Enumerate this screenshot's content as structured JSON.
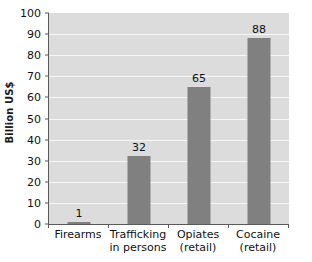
{
  "chart_data": {
    "type": "bar",
    "title": "",
    "xlabel": "",
    "ylabel": "Billion US$",
    "ylim": [
      0,
      100
    ],
    "ytick_labels": [
      "0",
      "10",
      "20",
      "30",
      "40",
      "50",
      "60",
      "70",
      "80",
      "90",
      "100"
    ],
    "ytick_values": [
      0,
      10,
      20,
      30,
      40,
      50,
      60,
      70,
      80,
      90,
      100
    ],
    "grid": "horizontal",
    "legend": "none",
    "categories": [
      "Firearms",
      "Trafficking in persons",
      "Opiates (retail)",
      "Cocaine (retail)"
    ],
    "category_lines": [
      [
        "Firearms"
      ],
      [
        "Trafficking",
        "in persons"
      ],
      [
        "Opiates",
        "(retail)"
      ],
      [
        "Cocaine",
        "(retail)"
      ]
    ],
    "values": [
      1,
      32,
      65,
      88
    ],
    "data_labels": [
      "1",
      "32",
      "65",
      "88"
    ],
    "bar_color": "#808080",
    "plot_background_color": "#dcdcdc",
    "gridline_color": "#f7f7f7",
    "axis_color": "#5a5a5a",
    "text_color": "#111111"
  }
}
